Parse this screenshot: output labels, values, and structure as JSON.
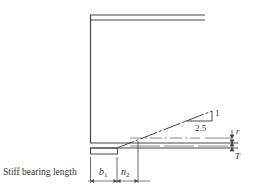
{
  "diagram": {
    "slope": {
      "rise": "1",
      "run": "2.5"
    },
    "labels": {
      "stiff_bearing": "Stiff bearing length",
      "b1": "b",
      "b1_sub": "1",
      "n2": "n",
      "n2_sub": "2",
      "r": "r",
      "T": "T"
    },
    "colors": {
      "line": "#444444",
      "background": "#ffffff"
    }
  }
}
